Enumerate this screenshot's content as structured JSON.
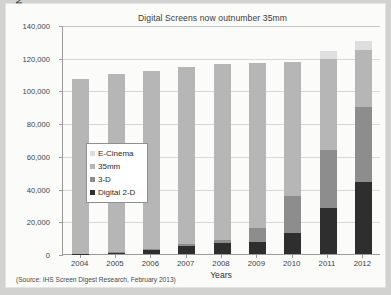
{
  "chart_data": {
    "type": "bar",
    "stacked": true,
    "title": "Digital Screens now outnumber 35mm",
    "xlabel": "Years",
    "ylabel": "Number of screens worldwide",
    "ylim": [
      0,
      140000
    ],
    "ytick_step": 20000,
    "ytick_labels": [
      "0",
      "20,000",
      "40,000",
      "60,000",
      "80,000",
      "100,000",
      "120,000",
      "140,000"
    ],
    "ytick_values": [
      0,
      20000,
      40000,
      60000,
      80000,
      100000,
      120000,
      140000
    ],
    "grid": true,
    "legend_position": "inside-left",
    "categories": [
      "2004",
      "2005",
      "2006",
      "2007",
      "2008",
      "2009",
      "2010",
      "2011",
      "2012"
    ],
    "series": [
      {
        "name": "Digital 2-D",
        "color": "#2e2e2e",
        "values": [
          200,
          900,
          2600,
          5200,
          6500,
          7600,
          13100,
          28300,
          44200
        ]
      },
      {
        "name": "3-D",
        "color": "#8d8d8d",
        "values": [
          0,
          100,
          400,
          800,
          2200,
          8200,
          22200,
          35500,
          45800
        ]
      },
      {
        "name": "35mm",
        "color": "#b6b6b6",
        "values": [
          106800,
          109000,
          109000,
          108500,
          107300,
          101000,
          82200,
          55400,
          34700
        ]
      },
      {
        "name": "E-Cinema",
        "color": "#dedede",
        "values": [
          0,
          0,
          0,
          0,
          0,
          0,
          0,
          4800,
          5300
        ]
      }
    ],
    "totals": [
      107000,
      110000,
      112000,
      114500,
      116000,
      116800,
      117500,
      124000,
      130000
    ],
    "source_note": "(Source: IHS Screen Digest Research, February 2013)"
  },
  "legend": {
    "items": [
      {
        "label": "E-Cinema",
        "color": "#dedede"
      },
      {
        "label": "35mm",
        "color": "#b6b6b6"
      },
      {
        "label": "3-D",
        "color": "#8d8d8d"
      },
      {
        "label": "Digital 2-D",
        "color": "#2e2e2e"
      }
    ]
  },
  "colors": {
    "page_background": "#d2d2d0",
    "card_background": "#fbfbfa",
    "axis": "#9a9a9a",
    "gridline": "#d8d8d6",
    "text": "#3b3b3b"
  }
}
